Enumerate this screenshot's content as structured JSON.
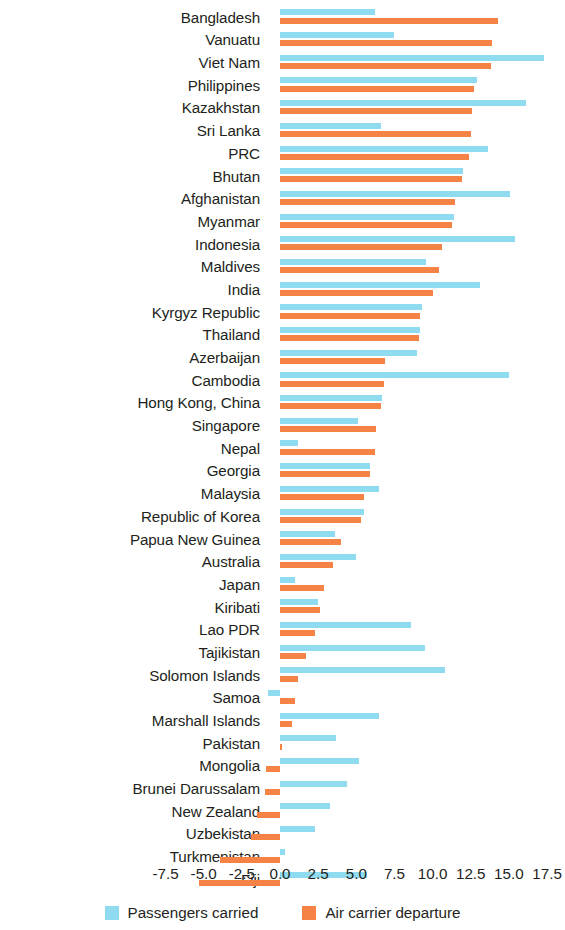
{
  "chart_data": {
    "type": "bar",
    "orientation": "horizontal",
    "title": "",
    "subtitle": "",
    "xlabel": "",
    "ylabel": "",
    "xlim": [
      -8.75,
      18.75
    ],
    "xticks": [
      "-7.5",
      "-5.0",
      "-2.5",
      "0.0",
      "2.5",
      "5.0",
      "7.5",
      "10.0",
      "12.5",
      "15.0",
      "17.5"
    ],
    "xtick_values": [
      -7.5,
      -5.0,
      -2.5,
      0.0,
      2.5,
      5.0,
      7.5,
      10.0,
      12.5,
      15.0,
      17.5
    ],
    "grid": false,
    "legend_position": "bottom",
    "categories": [
      "Bangladesh",
      "Vanuatu",
      "Viet Nam",
      "Philippines",
      "Kazakhstan",
      "Sri Lanka",
      "PRC",
      "Bhutan",
      "Afghanistan",
      "Myanmar",
      "Indonesia",
      "Maldives",
      "India",
      "Kyrgyz Republic",
      "Thailand",
      "Azerbaijan",
      "Cambodia",
      "Hong Kong, China",
      "Singapore",
      "Nepal",
      "Georgia",
      "Malaysia",
      "Republic of Korea",
      "Papua New Guinea",
      "Australia",
      "Japan",
      "Kiribati",
      "Lao PDR",
      "Tajikistan",
      "Solomon Islands",
      "Samoa",
      "Marshall Islands",
      "Pakistan",
      "Mongolia",
      "Brunei Darussalam",
      "New Zealand",
      "Uzbekistan",
      "Turkmenistan",
      "Fiji"
    ],
    "series": [
      {
        "name": "Passengers carried",
        "color": "#8fdcf0",
        "values": [
          6.2,
          7.5,
          17.3,
          12.9,
          16.1,
          6.6,
          13.6,
          12.0,
          15.1,
          11.4,
          15.4,
          9.6,
          13.1,
          9.3,
          9.2,
          9.0,
          15.0,
          6.7,
          5.1,
          1.2,
          5.9,
          6.5,
          5.5,
          3.6,
          5.0,
          1.0,
          2.5,
          8.6,
          9.5,
          10.8,
          -0.8,
          6.5,
          3.7,
          5.2,
          4.4,
          3.3,
          2.3,
          0.3,
          5.7
        ]
      },
      {
        "name": "Air carrier departure",
        "color": "#f58345",
        "values": [
          14.3,
          13.9,
          13.8,
          12.7,
          12.6,
          12.5,
          12.4,
          11.9,
          11.5,
          11.3,
          10.6,
          10.4,
          10.0,
          9.2,
          9.1,
          6.9,
          6.8,
          6.6,
          6.3,
          6.2,
          5.9,
          5.5,
          5.3,
          4.0,
          3.5,
          2.9,
          2.6,
          2.3,
          1.7,
          1.2,
          1.0,
          0.8,
          0.1,
          -0.9,
          -1.0,
          -1.5,
          -1.9,
          -3.9,
          -5.3
        ]
      }
    ]
  },
  "legend": {
    "entries": [
      {
        "label": "Passengers carried",
        "swatch": "legend-swatch-blue",
        "color": "#8fdcf0"
      },
      {
        "label": "Air carrier departure",
        "swatch": "legend-swatch-orange",
        "color": "#f58345"
      }
    ]
  }
}
